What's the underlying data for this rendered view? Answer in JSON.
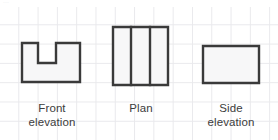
{
  "page": {
    "width": 278,
    "height": 140,
    "background_color": "#ffffff",
    "header_fragment_text": "..."
  },
  "grid": {
    "name": "graph-paper-grid",
    "line_color": "#e9e9ec",
    "cell_size_px": 19.3,
    "visible": true
  },
  "style": {
    "stroke_color": "#3a3a3a",
    "stroke_width": 2.4,
    "fill_color": "#f7f7f8",
    "label_color": "#3c3c3c"
  },
  "figures": [
    {
      "id": "front-elevation",
      "label": "Front\nelevation",
      "shape_type": "notched-rectangle",
      "bounds": {
        "x": 22,
        "y": 43,
        "width": 58,
        "height": 39
      },
      "notch": {
        "x": 38,
        "y": 43,
        "width": 18,
        "height": 20
      },
      "points": "22,43 38,43 38,63 56,63 56,43 80,43 80,82 22,82",
      "internal_lines": []
    },
    {
      "id": "plan",
      "label": "Plan",
      "shape_type": "rectangle-divided",
      "bounds": {
        "x": 113,
        "y": 27,
        "width": 55,
        "height": 58
      },
      "points": "113,27 168,27 168,85 113,85",
      "internal_lines": [
        {
          "x1": 131,
          "y1": 27,
          "x2": 131,
          "y2": 85
        },
        {
          "x1": 150,
          "y1": 27,
          "x2": 150,
          "y2": 85
        }
      ],
      "columns": 3
    },
    {
      "id": "side-elevation",
      "label": "Side\nelevation",
      "shape_type": "rectangle",
      "bounds": {
        "x": 203,
        "y": 46,
        "width": 56,
        "height": 37
      },
      "points": "203,46 259,46 259,83 203,83",
      "internal_lines": []
    }
  ]
}
